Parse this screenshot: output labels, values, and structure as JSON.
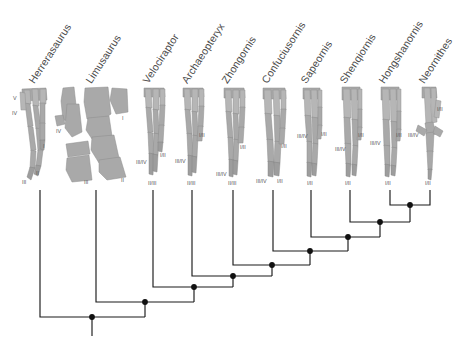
{
  "figure": {
    "kind": "cladogram-with-specimen-silhouettes",
    "background_color": "#ffffff",
    "branch_color": "#1a1a1a",
    "node_color": "#111111",
    "bone_fill": "#a9a9a9",
    "label_color": "#4a4a4a"
  },
  "taxa": [
    {
      "id": "herrerasaurus",
      "label": "Herrerasaurus",
      "tip_x": 40,
      "digit_labels": [
        {
          "text": "V",
          "x": 13,
          "y": 95
        },
        {
          "text": "IV",
          "x": 12,
          "y": 110
        },
        {
          "text": "I",
          "x": 43,
          "y": 143
        },
        {
          "text": "II",
          "x": 36,
          "y": 170
        },
        {
          "text": "III",
          "x": 22,
          "y": 179
        }
      ]
    },
    {
      "id": "limusaurus",
      "label": "Limusaurus",
      "tip_x": 96,
      "digit_labels": [
        {
          "text": "IV",
          "x": 56,
          "y": 128
        },
        {
          "text": "I",
          "x": 122,
          "y": 115
        },
        {
          "text": "III",
          "x": 84,
          "y": 179
        },
        {
          "text": "II",
          "x": 121,
          "y": 177
        }
      ]
    },
    {
      "id": "velociraptor",
      "label": "Velociraptor",
      "tip_x": 153,
      "digit_labels": [
        {
          "text": "I/II",
          "x": 160,
          "y": 152
        },
        {
          "text": "III/IV",
          "x": 136,
          "y": 159
        },
        {
          "text": "II/III",
          "x": 153,
          "y": 180
        }
      ]
    },
    {
      "id": "archaeopteryx",
      "label": "Archaeopteryx",
      "tip_x": 192,
      "digit_labels": [
        {
          "text": "I/II",
          "x": 199,
          "y": 132
        },
        {
          "text": "III/IV",
          "x": 175,
          "y": 158
        },
        {
          "text": "II/III",
          "x": 192,
          "y": 180
        }
      ]
    },
    {
      "id": "zhongornis",
      "label": "Zhongornis",
      "tip_x": 233,
      "digit_labels": [
        {
          "text": "I/II",
          "x": 240,
          "y": 144
        },
        {
          "text": "III/IV",
          "x": 216,
          "y": 171
        },
        {
          "text": "II/III",
          "x": 231,
          "y": 180
        }
      ]
    },
    {
      "id": "confuciusornis",
      "label": "Confuciusornis",
      "tip_x": 273,
      "digit_labels": [
        {
          "text": "I/II",
          "x": 281,
          "y": 143
        },
        {
          "text": "III/IV",
          "x": 259,
          "y": 178
        },
        {
          "text": "I/II",
          "x": 279,
          "y": 178
        }
      ]
    },
    {
      "id": "sapeornis",
      "label": "Sapeornis",
      "tip_x": 311,
      "digit_labels": [
        {
          "text": "III/IV",
          "x": 300,
          "y": 133
        },
        {
          "text": "I/II",
          "x": 321,
          "y": 131
        },
        {
          "text": "I/II",
          "x": 311,
          "y": 180
        }
      ]
    },
    {
      "id": "shenqiornis",
      "label": "Shenqiornis",
      "tip_x": 350,
      "digit_labels": [
        {
          "text": "I/II",
          "x": 358,
          "y": 132
        },
        {
          "text": "III/IV",
          "x": 338,
          "y": 146
        },
        {
          "text": "I/II",
          "x": 349,
          "y": 180
        }
      ]
    },
    {
      "id": "hongshanornis",
      "label": "Hongshanornis",
      "tip_x": 390,
      "digit_labels": [
        {
          "text": "I/II",
          "x": 396,
          "y": 132
        },
        {
          "text": "III/IV",
          "x": 372,
          "y": 140
        },
        {
          "text": "I/II",
          "x": 388,
          "y": 180
        }
      ]
    },
    {
      "id": "neornithes",
      "label": "Neornithes",
      "tip_x": 430,
      "digit_labels": [
        {
          "text": "I/II",
          "x": 436,
          "y": 106
        },
        {
          "text": "III/IV",
          "x": 410,
          "y": 132
        },
        {
          "text": "I/II",
          "x": 428,
          "y": 180
        }
      ]
    }
  ],
  "tree": {
    "root_stem": {
      "x": 92,
      "y_top": 317,
      "y_bottom": 336
    },
    "nodes": [
      {
        "id": "n1",
        "x": 92,
        "y": 317
      },
      {
        "id": "n2",
        "x": 145,
        "y": 302
      },
      {
        "id": "n3",
        "x": 194,
        "y": 287
      },
      {
        "id": "n4",
        "x": 233,
        "y": 276
      },
      {
        "id": "n5",
        "x": 272,
        "y": 265
      },
      {
        "id": "n6",
        "x": 310,
        "y": 251
      },
      {
        "id": "n7",
        "x": 348,
        "y": 237
      },
      {
        "id": "n8",
        "x": 380,
        "y": 222
      },
      {
        "id": "n9",
        "x": 410,
        "y": 205
      }
    ],
    "tip_y": 190,
    "clades": [
      {
        "joins": [
          "herrerasaurus",
          "rest"
        ],
        "node": "n1"
      },
      {
        "joins": [
          "limusaurus",
          "rest"
        ],
        "node": "n2"
      },
      {
        "joins": [
          "velociraptor",
          "rest"
        ],
        "node": "n3"
      },
      {
        "joins": [
          "archaeopteryx",
          "rest"
        ],
        "node": "n4"
      },
      {
        "joins": [
          "zhongornis",
          "rest"
        ],
        "node": "n5"
      },
      {
        "joins": [
          "confuciusornis",
          "rest"
        ],
        "node": "n6"
      },
      {
        "joins": [
          "sapeornis",
          "rest"
        ],
        "node": "n7"
      },
      {
        "joins": [
          "shenqiornis",
          "rest"
        ],
        "node": "n8"
      },
      {
        "joins": [
          "hongshanornis",
          "neornithes"
        ],
        "node": "n9"
      }
    ]
  }
}
